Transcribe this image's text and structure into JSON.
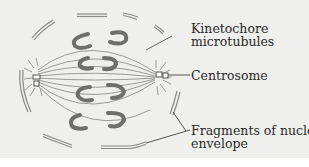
{
  "diagram": {
    "background_color": "#efefed",
    "chromosome_color": "#6e6e6e",
    "microtubule_color": "#9a9a9a",
    "envelope_color": "#8a8a8a",
    "labels": [
      {
        "id": "kinetochore",
        "line1": "Kinetochore",
        "line2": "microtubules"
      },
      {
        "id": "centrosome",
        "line1": "Centrosome"
      },
      {
        "id": "envelope",
        "line1": "Fragments of nuclear",
        "line2": "envelope"
      }
    ]
  }
}
